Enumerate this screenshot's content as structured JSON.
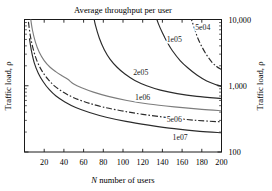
{
  "chart_data": {
    "type": "line",
    "title": "Average throughput per user",
    "xlabel": "N number of users",
    "ylabel": "Traffic load, ρ",
    "ylabel_right": "Traffic load, ρ",
    "xlim": [
      0,
      200
    ],
    "ylim": [
      100,
      10000
    ],
    "yscale": "log",
    "xscale": "linear",
    "grid": false,
    "legend_position": "inline-contour-labels",
    "xticks": [
      20,
      40,
      60,
      80,
      100,
      120,
      140,
      160,
      180,
      200
    ],
    "xticklabels": [
      "20",
      "40",
      "60",
      "80",
      "100",
      "120",
      "140",
      "160",
      "180",
      "200"
    ],
    "yticks": [
      100,
      1000,
      10000
    ],
    "yticklabels": [
      "100",
      "1,000",
      "10,000"
    ],
    "contour_levels": [
      "5e04",
      "1e05",
      "2e05",
      "1e06",
      "5e06",
      "1e07"
    ],
    "series": [
      {
        "name": "5e04",
        "label": "5e04",
        "style": "dash-dot",
        "color": "#2b2b2b",
        "label_x": 181,
        "label_y": 7000,
        "x": [
          168,
          170,
          173,
          176,
          180,
          185,
          190,
          195,
          200
        ],
        "y": [
          11500,
          9500,
          7000,
          5200,
          3900,
          2900,
          2300,
          1950,
          1750
        ]
      },
      {
        "name": "1e05",
        "label": "1e05",
        "style": "solid",
        "color": "#2b2b2b",
        "label_x": 152,
        "label_y": 4600,
        "x": [
          133,
          136,
          140,
          145,
          150,
          158,
          166,
          175,
          185,
          195,
          200
        ],
        "y": [
          11500,
          8600,
          6300,
          4500,
          3400,
          2400,
          1850,
          1450,
          1180,
          1030,
          980
        ]
      },
      {
        "name": "2e05",
        "label": "2e05",
        "style": "solid",
        "color": "#2b2b2b",
        "label_x": 118,
        "label_y": 1450,
        "x": [
          70,
          72,
          76,
          81,
          87,
          94,
          102,
          112,
          124,
          138,
          155,
          175,
          200
        ],
        "y": [
          11500,
          8200,
          5200,
          3500,
          2500,
          1900,
          1500,
          1200,
          1000,
          860,
          760,
          690,
          640
        ]
      },
      {
        "name": "1e06",
        "label": "1e06",
        "style": "solid",
        "color": "#7d7d7d",
        "label_x": 120,
        "label_y": 620,
        "x": [
          6,
          8,
          11,
          15,
          20,
          26,
          32,
          38,
          44,
          50,
          58,
          70,
          85,
          104,
          126,
          152,
          180,
          200
        ],
        "y": [
          11000,
          7000,
          4600,
          3200,
          2400,
          1900,
          1620,
          1420,
          1250,
          1060,
          930,
          800,
          690,
          600,
          530,
          480,
          440,
          420
        ]
      },
      {
        "name": "5e06",
        "label": "5e06",
        "style": "dash-dot",
        "color": "#2b2b2b",
        "label_x": 152,
        "label_y": 280,
        "x": [
          4,
          6,
          9,
          13,
          18,
          24,
          31,
          40,
          50,
          63,
          79,
          98,
          120,
          146,
          175,
          200
        ],
        "y": [
          9200,
          5600,
          3500,
          2300,
          1650,
          1250,
          980,
          790,
          660,
          560,
          480,
          420,
          370,
          330,
          300,
          285
        ]
      },
      {
        "name": "1e07",
        "label": "1e07",
        "style": "solid",
        "color": "#2b2b2b",
        "label_x": 158,
        "label_y": 152,
        "x": [
          5,
          7,
          10,
          14,
          19,
          25,
          32,
          41,
          52,
          66,
          83,
          103,
          126,
          152,
          178,
          200
        ],
        "y": [
          5200,
          3400,
          2200,
          1550,
          1150,
          880,
          700,
          570,
          470,
          395,
          335,
          290,
          255,
          225,
          205,
          195
        ]
      }
    ]
  }
}
